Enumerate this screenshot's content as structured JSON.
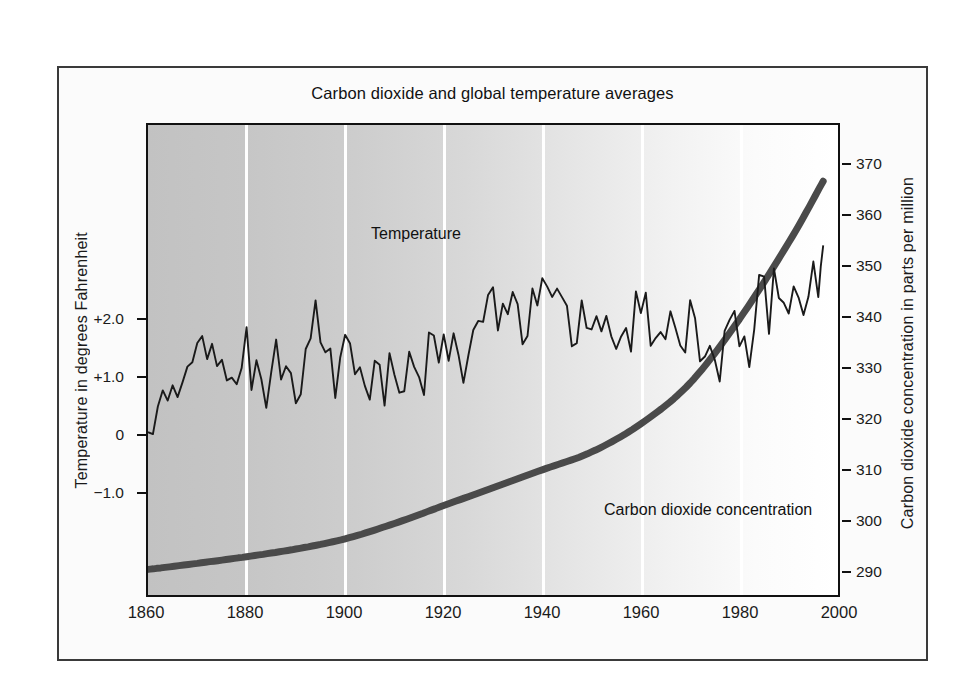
{
  "chart_data": {
    "type": "line",
    "title": "Carbon dioxide and global temperature averages",
    "xlabel": "",
    "xlim": [
      1860,
      2000
    ],
    "x_ticks": [
      1860,
      1880,
      1900,
      1920,
      1940,
      1960,
      1980,
      2000
    ],
    "grid": "vertical white gridlines at each x tick",
    "legend": "inline labels on plot",
    "background": "left-to-right gray-to-white gradient fill",
    "axes": [
      {
        "side": "left",
        "label": "Temperature  in degrees Fahrenheit",
        "ticks": [
          "+2.0",
          "+1.0",
          "0",
          "−1.0"
        ],
        "tick_values": [
          2.0,
          1.0,
          0,
          -1.0
        ],
        "ylim": [
          -1.6,
          2.5
        ]
      },
      {
        "side": "right",
        "label": "Carbon dioxide concentration in parts per million",
        "ticks": [
          "370",
          "360",
          "350",
          "340",
          "330",
          "320",
          "310",
          "300",
          "290"
        ],
        "tick_values": [
          370,
          360,
          350,
          340,
          330,
          320,
          310,
          300,
          290
        ],
        "ylim": [
          283,
          375
        ]
      }
    ],
    "series": [
      {
        "name": "Temperature",
        "axis": "left",
        "unit": "degrees Fahrenheit anomaly",
        "color": "#1a1a1a",
        "x": [
          1860,
          1862,
          1864,
          1866,
          1868,
          1870,
          1872,
          1874,
          1876,
          1878,
          1880,
          1882,
          1884,
          1886,
          1888,
          1890,
          1892,
          1894,
          1896,
          1898,
          1900,
          1902,
          1904,
          1906,
          1908,
          1910,
          1912,
          1914,
          1916,
          1918,
          1920,
          1922,
          1924,
          1926,
          1928,
          1930,
          1932,
          1934,
          1936,
          1938,
          1940,
          1942,
          1944,
          1946,
          1948,
          1950,
          1952,
          1954,
          1956,
          1958,
          1960,
          1962,
          1964,
          1966,
          1968,
          1970,
          1972,
          1974,
          1976,
          1978,
          1980,
          1982,
          1984,
          1986,
          1988,
          1990,
          1992,
          1994,
          1996,
          1997
        ],
        "values": [
          0.05,
          -0.15,
          0.3,
          0.1,
          0.45,
          0.62,
          0.4,
          0.55,
          0.35,
          0.22,
          0.52,
          0.3,
          0.18,
          0.4,
          0.25,
          0.1,
          0.35,
          1.0,
          0.45,
          0.2,
          0.55,
          0.3,
          0.15,
          0.48,
          0.22,
          0.4,
          0.18,
          0.62,
          0.3,
          0.7,
          0.45,
          0.58,
          0.35,
          0.75,
          0.92,
          1.05,
          0.72,
          0.85,
          0.6,
          0.95,
          1.12,
          0.8,
          1.02,
          0.7,
          0.88,
          0.58,
          0.8,
          0.65,
          0.82,
          0.7,
          0.95,
          0.75,
          0.55,
          0.85,
          0.62,
          0.8,
          0.45,
          0.7,
          0.35,
          0.95,
          0.72,
          0.58,
          1.05,
          0.9,
          1.18,
          1.05,
          0.95,
          1.12,
          1.05,
          1.45
        ]
      },
      {
        "name": "Carbon dioxide concentration",
        "axis": "right",
        "unit": "parts per million",
        "color": "#4a4a4a",
        "x": [
          1860,
          1870,
          1880,
          1890,
          1900,
          1910,
          1920,
          1930,
          1940,
          1950,
          1960,
          1970,
          1980,
          1990,
          1997
        ],
        "values": [
          288.0,
          289.2,
          290.5,
          292.0,
          294.0,
          297.0,
          300.5,
          304.0,
          307.5,
          311.0,
          316.5,
          324.5,
          337.0,
          352.0,
          364.0
        ]
      }
    ],
    "annotations": [
      {
        "text": "Temperature",
        "x_year": 1905,
        "y_value": 1.55,
        "axis": "left"
      },
      {
        "text": "Carbon dioxide concentration",
        "x_year": 1952,
        "y_value": 300,
        "axis": "right"
      }
    ]
  }
}
